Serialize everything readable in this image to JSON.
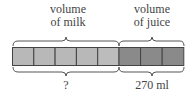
{
  "labels": {
    "milk_top_line1": "volume",
    "milk_top_line2": "of milk",
    "juice_top_line1": "volume",
    "juice_top_line2": "of juice",
    "milk_bottom": "?",
    "juice_bottom": "270 ml"
  },
  "bar": {
    "milk_units": 5,
    "juice_units": 3,
    "milk_color": "#b8b8b8",
    "juice_color": "#8a8a8a",
    "border_color": "#444444"
  }
}
